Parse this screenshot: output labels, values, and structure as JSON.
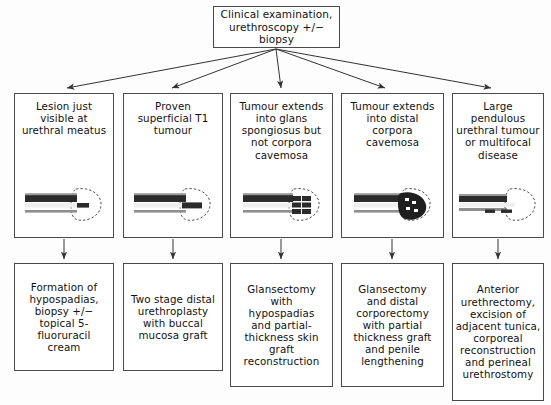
{
  "diagram": {
    "root": {
      "id": "clinical-examination",
      "text": "Clinical examination,\nurethroscopy +/− biopsy"
    },
    "branches": [
      {
        "id": "lesion-at-meatus",
        "stage": "Lesion just\nvisible at\nurethral meatus",
        "illustration": "urethra-lesion-meatus-diagram",
        "treatment": "Formation of\nhypospadias,\nbiopsy +/−\ntopical 5-\nfluoruracil\ncream"
      },
      {
        "id": "superficial-t1",
        "stage": "Proven\nsuperficial T1\ntumour",
        "illustration": "urethra-superficial-t1-diagram",
        "treatment": "Two stage distal\nurethroplasty\nwith buccal\nmucosa graft"
      },
      {
        "id": "glans-spongiosus",
        "stage": "Tumour extends\ninto glans\nspongiosus but\nnot corpora\ncavemosa",
        "illustration": "urethra-glans-spongiosus-diagram",
        "treatment": "Glansectomy\nwith\nhypospadias\nand partial-\nthickness skin\ngraft\nreconstruction"
      },
      {
        "id": "distal-corpora-cavernosa",
        "stage": "Tumour extends\ninto distal\ncorpora\ncavemosa",
        "illustration": "urethra-distal-corpora-diagram",
        "treatment": "Glansectomy\nand distal\ncorporectomy\nwith partial\nthickness graft\nand penile\nlengthening"
      },
      {
        "id": "large-pendulous-tumour",
        "stage": "Large\npendulous\nurethral tumour\nor multifocal\ndisease",
        "illustration": "urethra-pendulous-multifocal-diagram",
        "treatment": "Anterior\nurethrectomy,\nexcision of\nadjacent tunica,\ncorporeal\nreconstruction\nand perineal\nurethrostomy"
      }
    ],
    "colors": {
      "border": "#4a4a4a",
      "text": "#111111",
      "background": "#fdfdfd",
      "connector": "#333333",
      "tumour_dark": "#2b2b2b",
      "urethra_grey": "#8f8f8f"
    }
  }
}
